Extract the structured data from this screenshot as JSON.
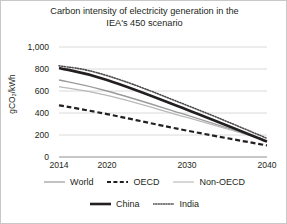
{
  "chart_data": {
    "type": "line",
    "title": "Carbon intensity of electricity generation in the IEA's 450 scenario",
    "xlabel": "",
    "ylabel": "gCO₂/kWh",
    "x": [
      2014,
      2020,
      2030,
      2040
    ],
    "xlim": [
      2014,
      2040
    ],
    "ylim": [
      0,
      1000
    ],
    "xticks": [
      "2014",
      "2020",
      "2030",
      "2040"
    ],
    "yticks": [
      "0",
      "200",
      "400",
      "600",
      "800",
      "1,000"
    ],
    "ytick_values": [
      0,
      200,
      400,
      600,
      800,
      1000
    ],
    "grid": "horizontal",
    "legend_position": "bottom",
    "series": [
      {
        "name": "World",
        "style": "solid-thin",
        "color": "#9a9a9a",
        "values": [
          700,
          600,
          380,
          150
        ]
      },
      {
        "name": "OECD",
        "style": "dashed",
        "color": "#231f20",
        "values": [
          470,
          390,
          240,
          105
        ]
      },
      {
        "name": "Non-OECD",
        "style": "solid-thin-light",
        "color": "#b9b9b9",
        "values": [
          640,
          560,
          360,
          150
        ]
      },
      {
        "name": "China",
        "style": "solid-thick",
        "color": "#231f20",
        "values": [
          810,
          700,
          430,
          140
        ]
      },
      {
        "name": "India",
        "style": "dotted",
        "color": "#4d4d4d",
        "values": [
          830,
          740,
          470,
          170
        ]
      }
    ]
  },
  "title": {
    "line1": "Carbon intensity of electricity generation in the",
    "line2": "IEA's 450 scenario"
  },
  "axes": {
    "y_title": "gCO₂/kWh",
    "y_ticks": [
      "1,000",
      "800",
      "600",
      "400",
      "200",
      "0"
    ],
    "x_ticks": [
      "2014",
      "2020",
      "2030",
      "2040"
    ]
  },
  "legend": {
    "row1": [
      {
        "label": "World",
        "swatch": "line-solid-thin-gray"
      },
      {
        "label": "OECD",
        "swatch": "line-dashed-black"
      },
      {
        "label": "Non-OECD",
        "swatch": "line-solid-thin-lightgray"
      }
    ],
    "row2": [
      {
        "label": "China",
        "swatch": "line-solid-thick-black"
      },
      {
        "label": "India",
        "swatch": "line-dotted-gray"
      }
    ]
  }
}
